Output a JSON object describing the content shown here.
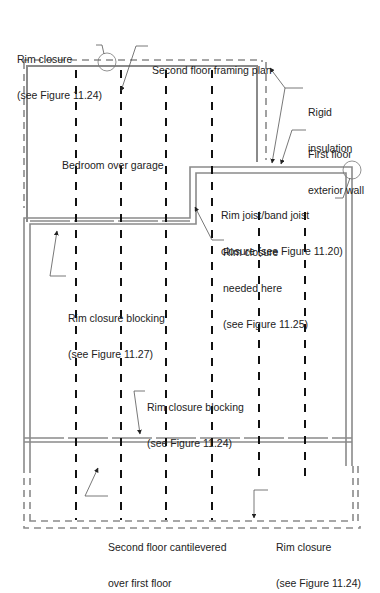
{
  "diagram": {
    "title": "Second floor framing plan",
    "room_label": "Bedroom over garage",
    "colors": {
      "wall": "#8a8a8a",
      "joist": "#111111",
      "insulation_dash": "#8a8a8a",
      "leader": "#555555",
      "text": "#222222"
    },
    "callouts": {
      "rim_closure_top": {
        "line1": "Rim closure",
        "line2": "(see Figure 11.24)"
      },
      "framing_plan": {
        "line1": "Second floor framing plan"
      },
      "rigid_insulation": {
        "line1": "Rigid",
        "line2": "insulation"
      },
      "first_floor_wall": {
        "line1": "First floor",
        "line2": "exterior wall"
      },
      "rim_joist_band": {
        "line1": "Rim joist/band joist",
        "line2": "closure (see Figure 11.20)"
      },
      "rim_closure_needed": {
        "line1": "Rim closure",
        "line2": "needed here",
        "line3": "(see Figure 11.25)"
      },
      "rim_blocking_left": {
        "line1": "Rim closure blocking",
        "line2": "(see Figure 11.27)"
      },
      "rim_blocking_bottom": {
        "line1": "Rim closure blocking",
        "line2": "(see Figure 11.24)"
      },
      "cantilever": {
        "line1": "Second floor cantilevered",
        "line2": "over first floor"
      },
      "rim_closure_bottom": {
        "line1": "Rim closure",
        "line2": "(see Figure 11.24)"
      }
    }
  }
}
